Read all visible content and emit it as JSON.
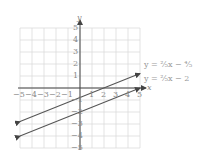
{
  "chart_data": {
    "type": "line",
    "title": "",
    "xlabel": "x",
    "ylabel": "y",
    "xlim": [
      -5,
      5
    ],
    "ylim": [
      -5,
      5
    ],
    "grid": true,
    "x_ticks": [
      "-5",
      "-4",
      "-3",
      "-2",
      "-1",
      "1",
      "2",
      "3",
      "4",
      "5"
    ],
    "y_ticks": [
      "5",
      "4",
      "3",
      "2",
      "1",
      "-1",
      "-2",
      "-3",
      "-4",
      "-5"
    ],
    "series": [
      {
        "name": "y = (2/5)x − 4/5",
        "slope": 0.4,
        "intercept": -0.8,
        "x": [
          -5,
          5
        ],
        "y": [
          -2.8,
          1.2
        ],
        "color": "#555555"
      },
      {
        "name": "y = (2/5)x − 2",
        "slope": 0.4,
        "intercept": -2,
        "x": [
          -5,
          5
        ],
        "y": [
          -4,
          0
        ],
        "color": "#555555"
      }
    ],
    "legend_position": "right, beside line ends"
  },
  "labels": {
    "x_axis": "x",
    "y_axis": "y",
    "eq1": "y = ²⁄₅x − ⁴⁄₅",
    "eq2": "y = ²⁄₅x − 2"
  }
}
